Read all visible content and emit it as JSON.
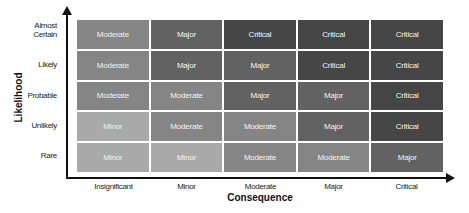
{
  "axes": {
    "y_title": "Likelihood",
    "x_title": "Consequence",
    "rows": [
      "Almost Certain",
      "Likely",
      "Probable",
      "Unlikely",
      "Rare"
    ],
    "columns": [
      "Insignificant",
      "Minor",
      "Moderate",
      "Major",
      "Critical"
    ]
  },
  "colors": {
    "Minor": "#a9a9a9",
    "Moderate": "#858585",
    "Major": "#626262",
    "Critical": "#464646"
  },
  "matrix": [
    [
      "Moderate",
      "Major",
      "Critical",
      "Critical",
      "Critical"
    ],
    [
      "Moderate",
      "Major",
      "Major",
      "Critical",
      "Critical"
    ],
    [
      "Moderate",
      "Moderate",
      "Major",
      "Major",
      "Critical"
    ],
    [
      "Minor",
      "Moderate",
      "Moderate",
      "Major",
      "Critical"
    ],
    [
      "Minor",
      "Minor",
      "Moderate",
      "Moderate",
      "Major"
    ]
  ]
}
